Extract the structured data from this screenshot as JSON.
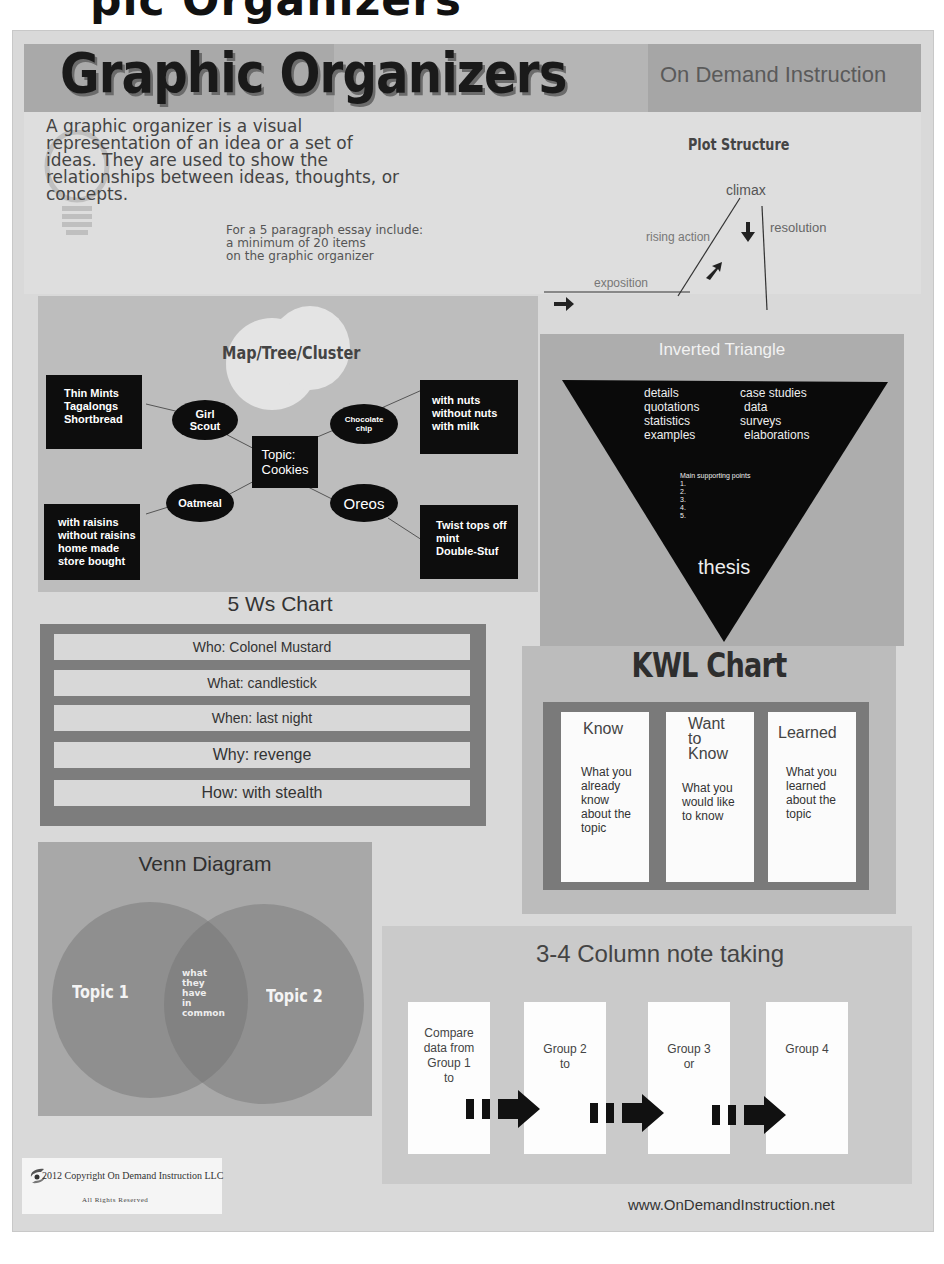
{
  "top_cut_title": "pic Organizers",
  "header": {
    "title": "Graphic Organizers",
    "subtitle": "On Demand Instruction"
  },
  "intro": {
    "text": "A graphic organizer is a visual representation of an idea or a set of ideas. They are used to show the relationships between ideas, thoughts, or concepts.",
    "essay_note_lines": [
      "For a 5 paragraph essay include:",
      "a minimum of 20 items",
      "on the graphic organizer"
    ],
    "icon": "lightbulb-icon"
  },
  "plot_structure": {
    "title": "Plot Structure",
    "labels": {
      "climax": "climax",
      "rising_action": "rising action",
      "resolution": "resolution",
      "exposition": "exposition"
    }
  },
  "map_cluster": {
    "title": "Map/Tree/Cluster",
    "topic": [
      "Topic:",
      "Cookies"
    ],
    "branches": [
      {
        "label": [
          "Girl",
          "Scout"
        ],
        "details": [
          "Thin Mints",
          "Tagalongs",
          "Shortbread"
        ]
      },
      {
        "label": [
          "Chocolate",
          "chip"
        ],
        "details": [
          "with nuts",
          "without nuts",
          "with milk"
        ]
      },
      {
        "label": [
          "Oatmeal"
        ],
        "details": [
          "with raisins",
          "without raisins",
          "home made",
          "store bought"
        ]
      },
      {
        "label": [
          "Oreos"
        ],
        "details": [
          "Twist tops off",
          "mint",
          "Double-Stuf"
        ]
      }
    ]
  },
  "inverted_triangle": {
    "title": "Inverted Triangle",
    "left_items": [
      "details",
      "quotations",
      "statistics",
      "examples"
    ],
    "right_items": [
      "case studies",
      "data",
      "surveys",
      "elaborations"
    ],
    "supporting_title": "Main supporting points",
    "supporting_points": [
      "1.",
      "2.",
      "3.",
      "4.",
      "5."
    ],
    "thesis": "thesis"
  },
  "five_ws": {
    "title": "5 Ws Chart",
    "rows": [
      "Who: Colonel Mustard",
      "What: candlestick",
      "When: last night",
      "Why: revenge",
      "How: with stealth"
    ]
  },
  "kwl": {
    "title": "KWL Chart",
    "columns": [
      {
        "head": [
          "Know"
        ],
        "body": [
          "What you",
          "already",
          "know",
          "about the",
          "topic"
        ]
      },
      {
        "head": [
          "Want",
          "to",
          "Know"
        ],
        "body": [
          "What you",
          "would like",
          "to know"
        ]
      },
      {
        "head": [
          "Learned"
        ],
        "body": [
          "What you",
          "learned",
          "about the",
          "topic"
        ]
      }
    ]
  },
  "venn": {
    "title": "Venn Diagram",
    "topic1": "Topic 1",
    "topic2": "Topic 2",
    "common": [
      "what",
      "they",
      "have",
      "in",
      "common"
    ]
  },
  "column_notes": {
    "title": "3-4 Column note taking",
    "boxes": [
      [
        "Compare",
        "data from",
        "Group 1",
        "to"
      ],
      [
        "Group 2",
        "to"
      ],
      [
        "Group 3",
        "or"
      ],
      [
        "Group 4"
      ]
    ]
  },
  "footer": {
    "copyright": "2012 Copyright On Demand Instruction LLC",
    "rights": "All Rights Reserved",
    "website": "www.OnDemandInstruction.net"
  },
  "colors": {
    "page_bg": "#d9d9d9",
    "black_box": "#0d0d0d",
    "dark_frame": "#7d7d7d"
  }
}
